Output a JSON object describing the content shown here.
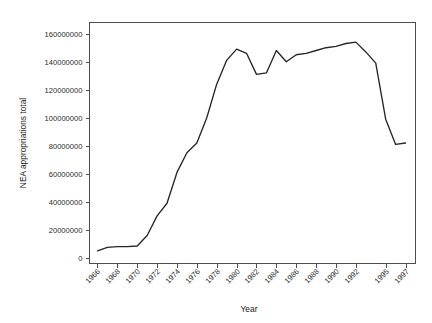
{
  "chart_data": {
    "type": "line",
    "title": "",
    "xlabel": "Year",
    "ylabel": "NEA appropriations total",
    "xlim": [
      1965.2,
      1998.0
    ],
    "ylim": [
      -4000000,
      168000000
    ],
    "grid": false,
    "legend": "none",
    "line_color": "#262626",
    "x": [
      1966,
      1967,
      1968,
      1969,
      1970,
      1971,
      1972,
      1973,
      1974,
      1975,
      1976,
      1977,
      1978,
      1979,
      1980,
      1981,
      1982,
      1983,
      1984,
      1985,
      1986,
      1987,
      1988,
      1989,
      1990,
      1991,
      1992,
      1993,
      1994,
      1995,
      1996,
      1997
    ],
    "values": [
      5000000,
      7500000,
      8000000,
      8000000,
      8500000,
      16000000,
      30000000,
      39000000,
      61000000,
      75000000,
      82000000,
      100000000,
      124000000,
      141000000,
      149000000,
      146000000,
      131000000,
      132000000,
      148000000,
      140000000,
      145000000,
      146000000,
      148000000,
      150000000,
      151000000,
      153000000,
      154000000,
      147000000,
      139000000,
      99000000,
      81000000,
      82000000
    ],
    "x_tick_labels": [
      "1966",
      "1968",
      "1970",
      "1972",
      "1974",
      "1976",
      "1978",
      "1980",
      "1982",
      "1984",
      "1986",
      "1988",
      "1990",
      "1992",
      "1995",
      "1997"
    ],
    "x_tick_values": [
      1966,
      1968,
      1970,
      1972,
      1974,
      1976,
      1978,
      1980,
      1982,
      1984,
      1986,
      1988,
      1990,
      1992,
      1995,
      1997
    ],
    "y_tick_labels": [
      "0",
      "20000000",
      "40000000",
      "60000000",
      "80000000",
      "100000000",
      "120000000",
      "140000000",
      "160000000"
    ],
    "y_tick_values": [
      0,
      20000000,
      40000000,
      60000000,
      80000000,
      100000000,
      120000000,
      140000000,
      160000000
    ]
  }
}
